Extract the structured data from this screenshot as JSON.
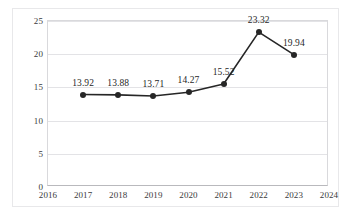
{
  "chart_data": {
    "type": "line",
    "title": "",
    "subtitle": "",
    "xlabel": "",
    "ylabel": "",
    "x": [
      2017,
      2018,
      2019,
      2020,
      2021,
      2022,
      2023
    ],
    "values": [
      13.92,
      13.88,
      13.71,
      14.27,
      15.52,
      23.32,
      19.94
    ],
    "point_labels": [
      "13.92",
      "13.88",
      "13.71",
      "14.27",
      "15.52",
      "23.32",
      "19.94"
    ],
    "xlim": [
      2016,
      2024
    ],
    "ylim": [
      0,
      25
    ],
    "x_ticks": [
      2016,
      2017,
      2018,
      2019,
      2020,
      2021,
      2022,
      2023,
      2024
    ],
    "x_tick_labels": [
      "2016",
      "2017",
      "2018",
      "2019",
      "2020",
      "2021",
      "2022",
      "2023",
      "2024"
    ],
    "y_ticks": [
      0,
      5,
      10,
      15,
      20,
      25
    ],
    "y_tick_labels": [
      "0",
      "5",
      "10",
      "15",
      "20",
      "25"
    ],
    "grid": "horizontal",
    "legend": "none",
    "series_color": "#262626",
    "marker": "circle",
    "show_data_labels": true,
    "colors": {
      "background": "#ffffff",
      "gridline": "#e3e3e6",
      "axis": "#b9b9bd",
      "frame": "#e8e8ea",
      "text": "#3a3a3c",
      "label_text": "#1f1f1f",
      "line": "#262626"
    }
  }
}
